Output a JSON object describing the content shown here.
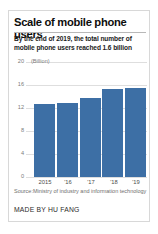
{
  "card": {
    "title": "Scale of mobile phone users",
    "subtitle": "By the end of 2019, the total number of mobile phone users reached 1.6 billion",
    "source_note": "Source:Ministry of industry and information technology",
    "byline": "MADE BY HU FANG",
    "accent_color": "#3d6fa5",
    "border_color": "#d8d8d8",
    "gridline_color": "#dedede"
  },
  "chart_data": {
    "type": "bar",
    "title": "Scale of mobile phone users",
    "subtitle": "By the end of 2019, the total number of mobile phone users reached 1.6 billion",
    "categories": [
      "2015",
      "'16",
      "'17",
      "'18",
      "'19"
    ],
    "values": [
      12.7,
      12.9,
      13.7,
      15.3,
      15.5
    ],
    "series": [
      {
        "name": "Mobile phone users",
        "values": [
          12.7,
          12.9,
          13.7,
          15.3,
          15.5
        ]
      }
    ],
    "xlabel": "",
    "ylabel": "(Billion)",
    "unit_label": "(Billion)",
    "ylim": [
      0,
      20
    ],
    "ytick_labels": [
      "20",
      "16",
      "12",
      "8",
      "4",
      "0"
    ],
    "ytick_values": [
      20,
      16,
      12,
      8,
      4,
      0
    ],
    "grid": true,
    "legend": false,
    "bar_color": "#3d6fa5",
    "source": "Source:Ministry of industry and information technology",
    "credit": "MADE BY HU FANG"
  }
}
